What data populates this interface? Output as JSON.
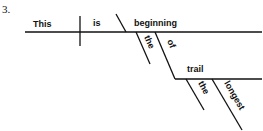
{
  "problem_number": "3.",
  "diagram": {
    "subject": "This",
    "verb": "is",
    "predicate_nominative": "beginning",
    "modifiers": {
      "article_1": "the",
      "preposition": "of",
      "object_of_preposition": "trail",
      "article_2": "the",
      "adjective": "longest"
    }
  },
  "colors": {
    "ink": "#111111",
    "background": "#ffffff"
  }
}
